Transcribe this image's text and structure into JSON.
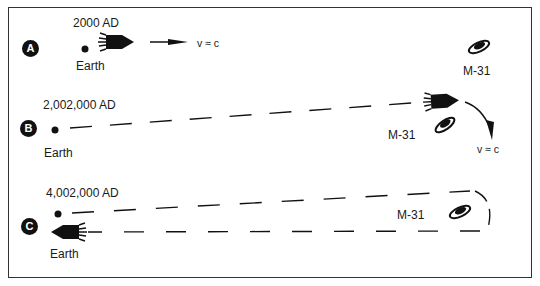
{
  "figure": {
    "panels": [
      {
        "id": "A",
        "date": "2000 AD",
        "earth_label": "Earth",
        "galaxy_label": "M-31",
        "velocity_label": "v ≈ c"
      },
      {
        "id": "B",
        "date": "2,002,000 AD",
        "earth_label": "Earth",
        "galaxy_label": "M-31",
        "velocity_label": "v ≈ c"
      },
      {
        "id": "C",
        "date": "4,002,000 AD",
        "earth_label": "Earth",
        "galaxy_label": "M-31"
      }
    ],
    "colors": {
      "ink": "#111111",
      "background": "#ffffff",
      "border": "#333333"
    }
  }
}
